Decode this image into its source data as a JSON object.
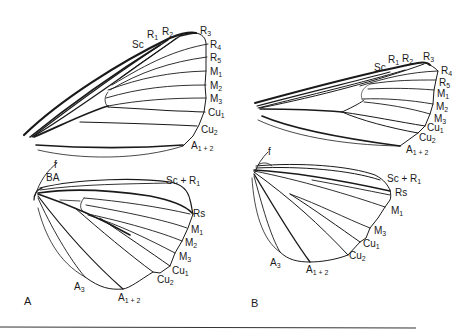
{
  "figure": {
    "panels": [
      {
        "id": "A",
        "label": "A",
        "forewing": {
          "veins": [
            {
              "name": "Sc",
              "base": "",
              "sub": ""
            },
            {
              "name": "R1",
              "base": "R",
              "sub": "1"
            },
            {
              "name": "R2",
              "base": "R",
              "sub": "2"
            },
            {
              "name": "R3",
              "base": "R",
              "sub": "3"
            },
            {
              "name": "R4",
              "base": "R",
              "sub": "4"
            },
            {
              "name": "R5",
              "base": "R",
              "sub": "5"
            },
            {
              "name": "M1",
              "base": "M",
              "sub": "1"
            },
            {
              "name": "M2",
              "base": "M",
              "sub": "2"
            },
            {
              "name": "M3",
              "base": "M",
              "sub": "3"
            },
            {
              "name": "Cu1",
              "base": "Cu",
              "sub": "1"
            },
            {
              "name": "Cu2",
              "base": "Cu",
              "sub": "2"
            },
            {
              "name": "A1+2",
              "base": "A",
              "sub": "1 + 2"
            }
          ]
        },
        "hindwing": {
          "veins": [
            {
              "name": "f",
              "base": "f",
              "sub": ""
            },
            {
              "name": "BA",
              "base": "BA",
              "sub": ""
            },
            {
              "name": "Sc+R1",
              "base": "Sc + R",
              "sub": "1"
            },
            {
              "name": "Rs",
              "base": "Rs",
              "sub": ""
            },
            {
              "name": "M1",
              "base": "M",
              "sub": "1"
            },
            {
              "name": "M2",
              "base": "M",
              "sub": "2"
            },
            {
              "name": "M3",
              "base": "M",
              "sub": "3"
            },
            {
              "name": "Cu1",
              "base": "Cu",
              "sub": "1"
            },
            {
              "name": "Cu2",
              "base": "Cu",
              "sub": "2"
            },
            {
              "name": "A3",
              "base": "A",
              "sub": "3"
            },
            {
              "name": "A1+2",
              "base": "A",
              "sub": "1 + 2"
            }
          ]
        }
      },
      {
        "id": "B",
        "label": "B",
        "forewing": {
          "veins": [
            {
              "name": "Sc",
              "base": "Sc",
              "sub": ""
            },
            {
              "name": "R1",
              "base": "R",
              "sub": "1"
            },
            {
              "name": "R2",
              "base": "R",
              "sub": "2"
            },
            {
              "name": "R3",
              "base": "R",
              "sub": "3"
            },
            {
              "name": "R4",
              "base": "R",
              "sub": "4"
            },
            {
              "name": "R5",
              "base": "R",
              "sub": "5"
            },
            {
              "name": "M1",
              "base": "M",
              "sub": "1"
            },
            {
              "name": "M2",
              "base": "M",
              "sub": "2"
            },
            {
              "name": "M3",
              "base": "M",
              "sub": "3"
            },
            {
              "name": "Cu1",
              "base": "Cu",
              "sub": "1"
            },
            {
              "name": "Cu2",
              "base": "Cu",
              "sub": "2"
            },
            {
              "name": "A1+2",
              "base": "A",
              "sub": "1 + 2"
            }
          ]
        },
        "hindwing": {
          "veins": [
            {
              "name": "f",
              "base": "f",
              "sub": ""
            },
            {
              "name": "Sc+R1",
              "base": "Sc + R",
              "sub": "1"
            },
            {
              "name": "Rs",
              "base": "Rs",
              "sub": ""
            },
            {
              "name": "M1",
              "base": "M",
              "sub": "1"
            },
            {
              "name": "M3",
              "base": "M",
              "sub": "3"
            },
            {
              "name": "Cu1",
              "base": "Cu",
              "sub": "1"
            },
            {
              "name": "Cu2",
              "base": "Cu",
              "sub": "2"
            },
            {
              "name": "A3",
              "base": "A",
              "sub": "3"
            },
            {
              "name": "A1+2",
              "base": "A",
              "sub": "1 + 2"
            }
          ]
        }
      }
    ]
  }
}
